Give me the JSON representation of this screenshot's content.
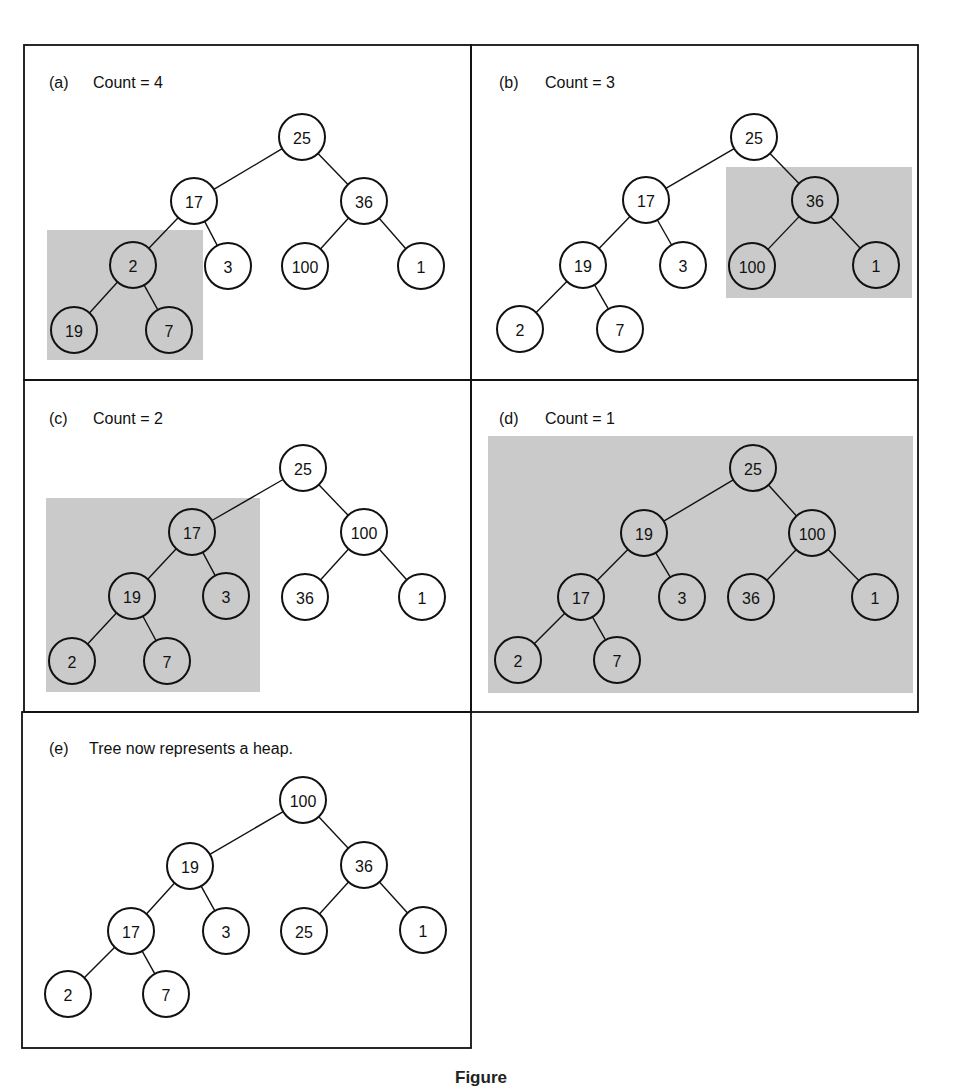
{
  "figure": {
    "caption": "Figure",
    "colors": {
      "stroke": "#111111",
      "highlight": "#cacaca",
      "background": "#ffffff"
    },
    "node_radius": 23
  },
  "chart_data": {
    "type": "diagram",
    "panels": [
      {
        "id": "a",
        "label": "(a)",
        "text": "Count = 4",
        "tree_level_order": [
          25,
          17,
          36,
          2,
          3,
          100,
          1,
          19,
          7
        ],
        "highlighted_subtree_root": 2
      },
      {
        "id": "b",
        "label": "(b)",
        "text": "Count = 3",
        "tree_level_order": [
          25,
          17,
          36,
          19,
          3,
          100,
          1,
          2,
          7
        ],
        "highlighted_subtree_root": 36
      },
      {
        "id": "c",
        "label": "(c)",
        "text": "Count = 2",
        "tree_level_order": [
          25,
          17,
          100,
          19,
          3,
          36,
          1,
          2,
          7
        ],
        "highlighted_subtree_root": 17
      },
      {
        "id": "d",
        "label": "(d)",
        "text": "Count = 1",
        "tree_level_order": [
          25,
          19,
          100,
          17,
          3,
          36,
          1,
          2,
          7
        ],
        "highlighted_subtree_root": 25
      },
      {
        "id": "e",
        "label": "(e)",
        "text": "Tree now represents a heap.",
        "tree_level_order": [
          100,
          19,
          36,
          17,
          3,
          25,
          1,
          2,
          7
        ],
        "highlighted_subtree_root": null
      }
    ]
  },
  "panels": [
    {
      "id": "a",
      "label": "(a)",
      "text": "Count = 4",
      "frame": {
        "x": 24,
        "y": 45,
        "w": 447,
        "h": 335
      },
      "label_pos": {
        "x": 49,
        "y": 88
      },
      "text_x": 93,
      "highlight": {
        "x": 47,
        "y": 230,
        "w": 156,
        "h": 130
      },
      "nodes": [
        {
          "v": "25",
          "x": 302,
          "y": 137
        },
        {
          "v": "17",
          "x": 194,
          "y": 201
        },
        {
          "v": "36",
          "x": 364,
          "y": 201
        },
        {
          "v": "2",
          "x": 133,
          "y": 265
        },
        {
          "v": "3",
          "x": 228,
          "y": 266
        },
        {
          "v": "100",
          "x": 305,
          "y": 266
        },
        {
          "v": "1",
          "x": 421,
          "y": 266
        },
        {
          "v": "19",
          "x": 74,
          "y": 330
        },
        {
          "v": "7",
          "x": 169,
          "y": 330
        }
      ],
      "edges": [
        [
          0,
          1
        ],
        [
          0,
          2
        ],
        [
          1,
          3
        ],
        [
          1,
          4
        ],
        [
          2,
          5
        ],
        [
          2,
          6
        ],
        [
          3,
          7
        ],
        [
          3,
          8
        ]
      ]
    },
    {
      "id": "b",
      "label": "(b)",
      "text": "Count = 3",
      "frame": {
        "x": 471,
        "y": 45,
        "w": 447,
        "h": 335
      },
      "label_pos": {
        "x": 499,
        "y": 88
      },
      "text_x": 545,
      "highlight": {
        "x": 726,
        "y": 167,
        "w": 186,
        "h": 131
      },
      "nodes": [
        {
          "v": "25",
          "x": 754,
          "y": 137
        },
        {
          "v": "17",
          "x": 646,
          "y": 200
        },
        {
          "v": "36",
          "x": 815,
          "y": 200
        },
        {
          "v": "19",
          "x": 583,
          "y": 265
        },
        {
          "v": "3",
          "x": 683,
          "y": 265
        },
        {
          "v": "100",
          "x": 752,
          "y": 266
        },
        {
          "v": "1",
          "x": 876,
          "y": 265
        },
        {
          "v": "2",
          "x": 520,
          "y": 329
        },
        {
          "v": "7",
          "x": 620,
          "y": 329
        }
      ],
      "edges": [
        [
          0,
          1
        ],
        [
          0,
          2
        ],
        [
          1,
          3
        ],
        [
          1,
          4
        ],
        [
          2,
          5
        ],
        [
          2,
          6
        ],
        [
          3,
          7
        ],
        [
          3,
          8
        ]
      ]
    },
    {
      "id": "c",
      "label": "(c)",
      "text": "Count = 2",
      "frame": {
        "x": 24,
        "y": 380,
        "w": 447,
        "h": 332
      },
      "label_pos": {
        "x": 49,
        "y": 424
      },
      "text_x": 93,
      "highlight": {
        "x": 46,
        "y": 498,
        "w": 214,
        "h": 194
      },
      "nodes": [
        {
          "v": "25",
          "x": 303,
          "y": 468
        },
        {
          "v": "17",
          "x": 192,
          "y": 532
        },
        {
          "v": "100",
          "x": 364,
          "y": 532
        },
        {
          "v": "19",
          "x": 132,
          "y": 596
        },
        {
          "v": "3",
          "x": 226,
          "y": 596
        },
        {
          "v": "36",
          "x": 305,
          "y": 597
        },
        {
          "v": "1",
          "x": 422,
          "y": 597
        },
        {
          "v": "2",
          "x": 72,
          "y": 661
        },
        {
          "v": "7",
          "x": 167,
          "y": 661
        }
      ],
      "edges": [
        [
          0,
          1
        ],
        [
          0,
          2
        ],
        [
          1,
          3
        ],
        [
          1,
          4
        ],
        [
          2,
          5
        ],
        [
          2,
          6
        ],
        [
          3,
          7
        ],
        [
          3,
          8
        ]
      ]
    },
    {
      "id": "d",
      "label": "(d)",
      "text": "Count = 1",
      "frame": {
        "x": 471,
        "y": 380,
        "w": 447,
        "h": 332
      },
      "label_pos": {
        "x": 499,
        "y": 424
      },
      "text_x": 545,
      "highlight": {
        "x": 488,
        "y": 436,
        "w": 425,
        "h": 257
      },
      "nodes": [
        {
          "v": "25",
          "x": 753,
          "y": 468
        },
        {
          "v": "19",
          "x": 644,
          "y": 533
        },
        {
          "v": "100",
          "x": 812,
          "y": 533
        },
        {
          "v": "17",
          "x": 581,
          "y": 597
        },
        {
          "v": "3",
          "x": 682,
          "y": 597
        },
        {
          "v": "36",
          "x": 751,
          "y": 597
        },
        {
          "v": "1",
          "x": 875,
          "y": 597
        },
        {
          "v": "2",
          "x": 518,
          "y": 660
        },
        {
          "v": "7",
          "x": 617,
          "y": 660
        }
      ],
      "edges": [
        [
          0,
          1
        ],
        [
          0,
          2
        ],
        [
          1,
          3
        ],
        [
          1,
          4
        ],
        [
          2,
          5
        ],
        [
          2,
          6
        ],
        [
          3,
          7
        ],
        [
          3,
          8
        ]
      ]
    },
    {
      "id": "e",
      "label": "(e)",
      "text": "Tree now represents a heap.",
      "frame": {
        "x": 22,
        "y": 712,
        "w": 449,
        "h": 336
      },
      "label_pos": {
        "x": 49,
        "y": 754
      },
      "text_x": 89,
      "highlight": null,
      "nodes": [
        {
          "v": "100",
          "x": 303,
          "y": 800
        },
        {
          "v": "19",
          "x": 190,
          "y": 866
        },
        {
          "v": "36",
          "x": 364,
          "y": 865
        },
        {
          "v": "17",
          "x": 131,
          "y": 931
        },
        {
          "v": "3",
          "x": 226,
          "y": 931
        },
        {
          "v": "25",
          "x": 304,
          "y": 931
        },
        {
          "v": "1",
          "x": 423,
          "y": 930
        },
        {
          "v": "2",
          "x": 68,
          "y": 994
        },
        {
          "v": "7",
          "x": 166,
          "y": 994
        }
      ],
      "edges": [
        [
          0,
          1
        ],
        [
          0,
          2
        ],
        [
          1,
          3
        ],
        [
          1,
          4
        ],
        [
          2,
          5
        ],
        [
          2,
          6
        ],
        [
          3,
          7
        ],
        [
          3,
          8
        ]
      ]
    }
  ]
}
